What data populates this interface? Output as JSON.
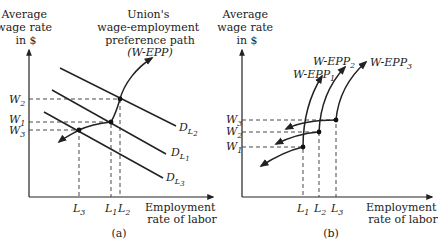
{
  "panel_a": {
    "y_axis_label": [
      "Average",
      "wage rate",
      "in $"
    ],
    "x_axis_label": [
      "Employment",
      "rate of labor"
    ],
    "caption": "(a)",
    "path_title": [
      "Union's",
      "wage-employment",
      "preference path"
    ],
    "path_abbrev": "(W-EPP)",
    "wage_ticks": [
      {
        "base": "W",
        "sub": "2"
      },
      {
        "base": "W",
        "sub": "1"
      },
      {
        "base": "W",
        "sub": "3"
      }
    ],
    "labor_ticks": [
      {
        "base": "L",
        "sub": "3"
      },
      {
        "base": "L",
        "sub": "1"
      },
      {
        "base": "L",
        "sub": "2"
      }
    ],
    "demand_curves": [
      {
        "base": "D",
        "sub": "L",
        "subsub": "2"
      },
      {
        "base": "D",
        "sub": "L",
        "subsub": "1"
      },
      {
        "base": "D",
        "sub": "L",
        "subsub": "3"
      }
    ]
  },
  "panel_b": {
    "y_axis_label": [
      "Average",
      "wage rate",
      "in $"
    ],
    "x_axis_label": [
      "Employment",
      "rate of labor"
    ],
    "caption": "(b)",
    "wage_ticks": [
      {
        "base": "W",
        "sub": "3"
      },
      {
        "base": "W",
        "sub": "2"
      },
      {
        "base": "W",
        "sub": "1"
      }
    ],
    "labor_ticks": [
      {
        "base": "L",
        "sub": "1"
      },
      {
        "base": "L",
        "sub": "2"
      },
      {
        "base": "L",
        "sub": "3"
      }
    ],
    "paths": [
      {
        "base": "W-EPP",
        "sub": "1"
      },
      {
        "base": "W-EPP",
        "sub": "2"
      },
      {
        "base": "W-EPP",
        "sub": "3"
      }
    ]
  }
}
